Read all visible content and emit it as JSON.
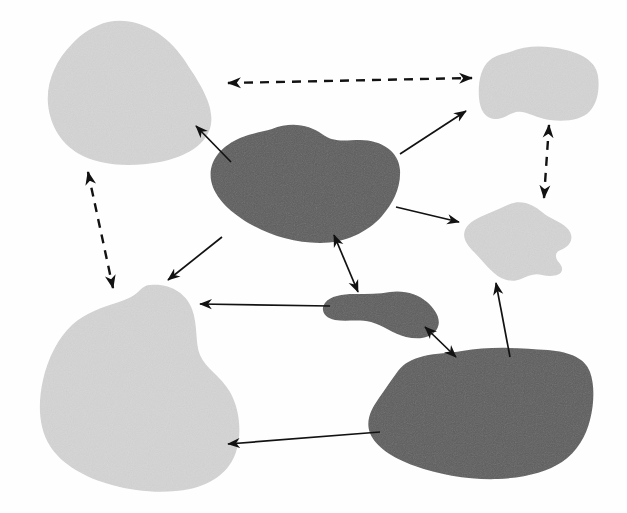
{
  "figure": {
    "title": "",
    "width": 627,
    "height": 513,
    "background_color": "#fefefe",
    "type": "node-link-blob-diagram"
  },
  "palette": {
    "light_gray_fill": "#d4d4d4",
    "dark_gray_fill": "#5d5d5d",
    "arrow_color": "#121212",
    "background": "#fefefe"
  },
  "nodes": [
    {
      "id": "patch-top-left",
      "name": "patch-top-left",
      "fill": "light_gray_fill",
      "shade": "light",
      "center": [
        130,
        93
      ],
      "path": "M 108 22 C 136 16, 165 32, 183 58 C 199 82, 214 104, 211 124 C 208 144, 186 157, 160 162 C 132 167, 104 166, 83 156 C 62 146, 50 126, 48 104 C 46 82, 56 60, 72 44 C 82 33, 95 25, 108 22 Z"
    },
    {
      "id": "patch-center-dark",
      "name": "patch-center-dark",
      "fill": "dark_gray_fill",
      "shade": "dark",
      "center": [
        303,
        185
      ],
      "path": "M 272 129 C 291 121, 310 125, 322 134 C 334 143, 345 140, 360 140 C 382 140, 399 152, 400 170 C 401 188, 393 203, 382 216 C 368 232, 345 243, 320 243 C 295 243, 272 236, 252 225 C 232 214, 214 198, 211 180 C 208 160, 222 146, 240 138 C 252 133, 262 132, 272 129 Z"
    },
    {
      "id": "patch-top-right",
      "name": "patch-top-right",
      "fill": "light_gray_fill",
      "shade": "light",
      "center": [
        546,
        82
      ],
      "path": "M 510 52 C 528 44, 549 46, 566 50 C 583 54, 596 62, 598 76 C 600 90, 597 103, 590 111 C 582 120, 566 122, 550 120 C 536 118, 525 110, 516 112 C 508 114, 503 120, 494 119 C 485 118, 480 110, 479 98 C 478 84, 480 68, 490 60 C 496 55, 503 54, 510 52 Z"
    },
    {
      "id": "patch-right-middle",
      "name": "patch-right-middle",
      "fill": "light_gray_fill",
      "shade": "light",
      "center": [
        526,
        240
      ],
      "path": "M 510 204 C 522 199, 534 205, 542 212 C 550 219, 560 221, 567 228 C 574 235, 572 243, 566 247 C 561 251, 556 250, 556 256 C 556 262, 563 264, 562 270 C 561 276, 551 277, 542 275 C 534 273, 528 276, 521 279 C 512 283, 502 280, 494 273 C 486 266, 480 258, 474 252 C 467 245, 462 238, 465 230 C 468 222, 478 218, 487 214 C 496 210, 503 207, 510 204 Z"
    },
    {
      "id": "patch-bottom-left",
      "name": "patch-bottom-left",
      "fill": "light_gray_fill",
      "shade": "light",
      "center": [
        133,
        390
      ]
    },
    {
      "id": "patch-small-dark",
      "name": "patch-small-dark",
      "fill": "dark_gray_fill",
      "shade": "dark",
      "center": [
        385,
        312
      ],
      "path": "M 390 292 C 404 290, 418 294, 427 302 C 436 310, 442 320, 437 329 C 432 338, 419 340, 406 337 C 393 334, 383 325, 371 322 C 359 319, 346 322, 335 320 C 324 318, 320 310, 325 303 C 330 296, 342 294, 355 294 C 368 294, 379 294, 390 292 Z"
    },
    {
      "id": "patch-bottom-right-dark",
      "name": "patch-bottom-right-dark",
      "fill": "dark_gray_fill",
      "shade": "dark",
      "center": [
        486,
        410
      ],
      "path": "M 462 351 C 490 346, 520 348, 548 350 C 570 352, 585 358, 590 372 C 595 386, 594 404, 590 420 C 586 436, 577 452, 562 462 C 547 472, 524 478, 498 479 C 470 480, 440 475, 415 466 C 392 458, 375 446, 370 433 C 365 420, 372 408, 379 398 C 386 388, 392 379, 398 371 C 404 363, 412 359, 424 356 C 436 353, 450 353, 462 351 Z"
    }
  ],
  "edges": [
    {
      "id": "edge-topleft-topright",
      "name": "edge-top-left-to-top-right",
      "from": "patch-top-left",
      "to": "patch-top-right",
      "style": "dashed",
      "heads": "both",
      "x1": 228,
      "y1": 83,
      "x2": 472,
      "y2": 78
    },
    {
      "id": "edge-topleft-bottomleft",
      "name": "edge-top-left-to-bottom-left",
      "from": "patch-top-left",
      "to": "patch-bottom-left",
      "style": "dashed",
      "heads": "both",
      "x1": 88,
      "y1": 172,
      "x2": 113,
      "y2": 288
    },
    {
      "id": "edge-topright-rightmiddle",
      "name": "edge-top-right-to-right-middle",
      "from": "patch-top-right",
      "to": "patch-right-middle",
      "style": "dashed",
      "heads": "both",
      "x1": 549,
      "y1": 125,
      "x2": 544,
      "y2": 198
    },
    {
      "id": "edge-center-topleft",
      "name": "edge-center-to-top-left",
      "from": "patch-center-dark",
      "to": "patch-top-left",
      "style": "solid",
      "heads": "end",
      "x1": 231,
      "y1": 162,
      "x2": 196,
      "y2": 126
    },
    {
      "id": "edge-center-topright",
      "name": "edge-center-to-top-right",
      "from": "patch-center-dark",
      "to": "patch-top-right",
      "style": "solid",
      "heads": "end",
      "x1": 400,
      "y1": 154,
      "x2": 466,
      "y2": 111
    },
    {
      "id": "edge-center-rightmiddle",
      "name": "edge-center-to-right-middle",
      "from": "patch-center-dark",
      "to": "patch-right-middle",
      "style": "solid",
      "heads": "end",
      "x1": 396,
      "y1": 207,
      "x2": 459,
      "y2": 222
    },
    {
      "id": "edge-center-bottomleft",
      "name": "edge-center-to-bottom-left",
      "from": "patch-center-dark",
      "to": "patch-bottom-left",
      "style": "solid",
      "heads": "end",
      "x1": 222,
      "y1": 237,
      "x2": 168,
      "y2": 280
    },
    {
      "id": "edge-center-smalldark",
      "name": "edge-center-to-small-dark",
      "from": "patch-center-dark",
      "to": "patch-small-dark",
      "style": "solid",
      "heads": "both",
      "x1": 334,
      "y1": 235,
      "x2": 358,
      "y2": 292
    },
    {
      "id": "edge-smalldark-bottomleft",
      "name": "edge-small-dark-to-bottom-left",
      "from": "patch-small-dark",
      "to": "patch-bottom-left",
      "style": "solid",
      "heads": "end",
      "x1": 330,
      "y1": 306,
      "x2": 200,
      "y2": 304
    },
    {
      "id": "edge-smalldark-bottomright",
      "name": "edge-small-dark-to-bottom-right",
      "from": "patch-small-dark",
      "to": "patch-bottom-right-dark",
      "style": "solid",
      "heads": "both",
      "x1": 425,
      "y1": 327,
      "x2": 456,
      "y2": 357
    },
    {
      "id": "edge-bottomright-rightmiddle",
      "name": "edge-bottom-right-to-right-middle",
      "from": "patch-bottom-right-dark",
      "to": "patch-right-middle",
      "style": "solid",
      "heads": "end",
      "x1": 510,
      "y1": 357,
      "x2": 496,
      "y2": 283
    },
    {
      "id": "edge-bottomright-bottomleft",
      "name": "edge-bottom-right-to-bottom-left",
      "from": "patch-bottom-right-dark",
      "to": "patch-bottom-left",
      "style": "solid",
      "heads": "end",
      "x1": 380,
      "y1": 432,
      "x2": 228,
      "y2": 444
    }
  ],
  "counts": {
    "nodes": 7,
    "light_nodes": 4,
    "dark_nodes": 3,
    "edges": 12,
    "dashed_edges": 3,
    "solid_edges": 9
  }
}
